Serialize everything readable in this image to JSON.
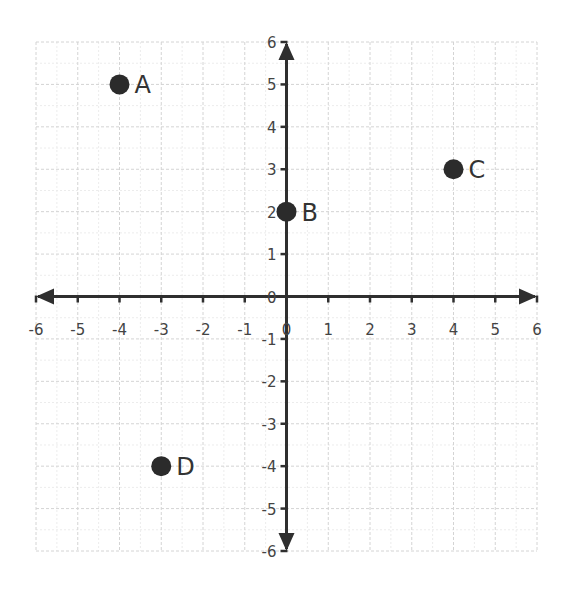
{
  "chart_data": {
    "type": "scatter",
    "title": "",
    "xlabel": "",
    "ylabel": "",
    "xlim": [
      -6,
      6
    ],
    "ylim": [
      -6,
      6
    ],
    "grid": true,
    "minor_grid": true,
    "x_ticks": [
      -6,
      -5,
      -4,
      -3,
      -2,
      -1,
      0,
      1,
      2,
      3,
      4,
      5,
      6
    ],
    "y_ticks": [
      -6,
      -5,
      -4,
      -3,
      -2,
      -1,
      0,
      1,
      2,
      3,
      4,
      5,
      6
    ],
    "axes_arrows": true,
    "points": [
      {
        "label": "A",
        "x": -4,
        "y": 5
      },
      {
        "label": "B",
        "x": 0,
        "y": 2
      },
      {
        "label": "C",
        "x": 4,
        "y": 3
      },
      {
        "label": "D",
        "x": -3,
        "y": -4
      }
    ],
    "colors": {
      "point": "#2b2b2b",
      "axis": "#2f2f2f",
      "grid": "#d4d4d4",
      "text": "#444444"
    }
  }
}
